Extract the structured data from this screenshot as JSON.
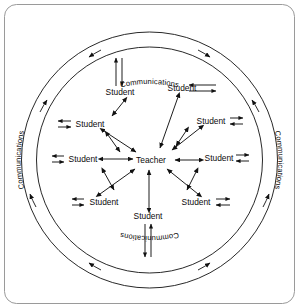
{
  "figure": {
    "frame": {
      "x": 4,
      "y": 4,
      "width": 291,
      "height": 300,
      "radius": 12,
      "border_color": "#9a9a9a",
      "background": "#ffffff"
    },
    "line_color": "#111111",
    "center": {
      "cx": 149.5,
      "cy": 160
    },
    "rings": {
      "outer_radius": 128,
      "inner_radius": 113,
      "label_radius": 120.5
    }
  },
  "center_node": {
    "label": "Teacher",
    "x": 151,
    "y": 160
  },
  "ring_labels": [
    {
      "id": "communications-top",
      "text": "Communications",
      "position": "top",
      "orientation": "upright"
    },
    {
      "id": "communications-right",
      "text": "Communications",
      "position": "right",
      "orientation": "top-to-bottom"
    },
    {
      "id": "communications-bottom",
      "text": "Communications",
      "position": "bottom",
      "orientation": "inverted"
    },
    {
      "id": "communications-left",
      "text": "Communications",
      "position": "left",
      "orientation": "bottom-to-top"
    }
  ],
  "student_nodes": [
    {
      "id": "student-top-left",
      "label": "Student",
      "x": 120,
      "y": 92,
      "link_side": "up"
    },
    {
      "id": "student-top-right",
      "label": "Student",
      "x": 182,
      "y": 88,
      "link_side": "right-long"
    },
    {
      "id": "student-left-upper",
      "label": "Student",
      "x": 90,
      "y": 124,
      "link_side": "left"
    },
    {
      "id": "student-right-upper",
      "label": "Student",
      "x": 211,
      "y": 121,
      "link_side": "right"
    },
    {
      "id": "student-left-lower",
      "label": "Student",
      "x": 83,
      "y": 159,
      "link_side": "left"
    },
    {
      "id": "student-right-lower",
      "label": "Student",
      "x": 219,
      "y": 158,
      "link_side": "right"
    },
    {
      "id": "student-bottom-left",
      "label": "Student",
      "x": 104,
      "y": 202,
      "link_side": "left"
    },
    {
      "id": "student-bottom-right",
      "label": "Student",
      "x": 196,
      "y": 202,
      "link_side": "right"
    },
    {
      "id": "student-bottom",
      "label": "Student",
      "x": 148,
      "y": 216,
      "link_side": "down"
    }
  ],
  "teacher_links": [
    {
      "from": "student-top-left",
      "type": "double-headed"
    },
    {
      "from": "student-top-right",
      "type": "double-headed"
    },
    {
      "from": "student-left-upper",
      "type": "double-headed"
    },
    {
      "from": "student-right-upper",
      "type": "double-headed"
    },
    {
      "from": "student-left-lower",
      "type": "double-headed"
    },
    {
      "from": "student-right-lower",
      "type": "double-headed"
    },
    {
      "from": "student-bottom-left",
      "type": "double-headed"
    },
    {
      "from": "student-bottom-right",
      "type": "double-headed"
    },
    {
      "from": "student-bottom",
      "type": "double-headed"
    }
  ],
  "arc_arrows": {
    "count": 8,
    "description": "arrowheads along both concentric rings at top, bottom, left and right quadrants"
  }
}
